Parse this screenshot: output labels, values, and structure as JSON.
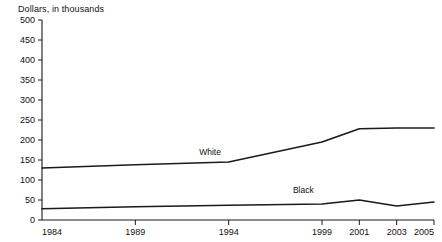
{
  "chart_data": {
    "type": "line",
    "title": "",
    "ylabel": "Dollars, in thousands",
    "xlabel": "",
    "ylim": [
      0,
      500
    ],
    "ytick_values": [
      0,
      50,
      100,
      150,
      200,
      250,
      300,
      350,
      400,
      450,
      500
    ],
    "ytick_labels": [
      "0",
      "50",
      "100",
      "150",
      "200",
      "250",
      "300",
      "350",
      "400",
      "450",
      "500"
    ],
    "categories": [
      "1984",
      "1989",
      "1994",
      "1999",
      "2001",
      "2003",
      "2005"
    ],
    "x": [
      1984,
      1989,
      1994,
      1999,
      2001,
      2003,
      2005
    ],
    "grid": false,
    "legend": "inline-annotation",
    "series": [
      {
        "name": "White",
        "label": "White",
        "values": [
          130,
          138,
          145,
          195,
          228,
          230,
          230
        ],
        "color": "#1a1a1a"
      },
      {
        "name": "Black",
        "label": "Black",
        "values": [
          28,
          33,
          37,
          40,
          50,
          35,
          45
        ],
        "color": "#1a1a1a"
      }
    ],
    "annotations": [
      {
        "text": "White",
        "x": 1993,
        "y": 163
      },
      {
        "text": "Black",
        "x": 1998,
        "y": 68
      }
    ]
  }
}
